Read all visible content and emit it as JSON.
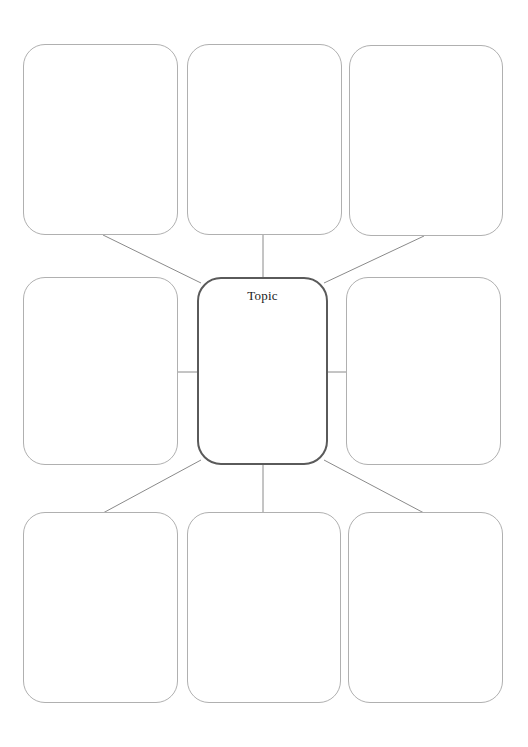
{
  "page": {
    "background_color": "#ffffff",
    "width": 528,
    "height": 747
  },
  "styles": {
    "node_border_color": "#b0b0b0",
    "center_border_color": "#5a5a5a",
    "connector_color": "#8a8a8a",
    "label_color": "#1b1b1b"
  },
  "organizer": {
    "center": {
      "id": "center-topic",
      "label": "Topic",
      "x": 197,
      "y": 277,
      "width": 131,
      "height": 188
    },
    "nodes": [
      {
        "id": "node-top-left",
        "label": "",
        "x": 23,
        "y": 44,
        "width": 155,
        "height": 191
      },
      {
        "id": "node-top-center",
        "label": "",
        "x": 187,
        "y": 44,
        "width": 155,
        "height": 191
      },
      {
        "id": "node-top-right",
        "label": "",
        "x": 349,
        "y": 45,
        "width": 154,
        "height": 191
      },
      {
        "id": "node-middle-left",
        "label": "",
        "x": 23,
        "y": 277,
        "width": 155,
        "height": 188
      },
      {
        "id": "node-middle-right",
        "label": "",
        "x": 346,
        "y": 277,
        "width": 155,
        "height": 188
      },
      {
        "id": "node-bottom-left",
        "label": "",
        "x": 23,
        "y": 512,
        "width": 155,
        "height": 191
      },
      {
        "id": "node-bottom-center",
        "label": "",
        "x": 187,
        "y": 512,
        "width": 154,
        "height": 191
      },
      {
        "id": "node-bottom-right",
        "label": "",
        "x": 348,
        "y": 512,
        "width": 155,
        "height": 191
      }
    ],
    "connectors": [
      {
        "id": "connector-top-left",
        "from": "node-top-left",
        "to": "center-topic",
        "x1": 103,
        "y1": 235,
        "x2": 201,
        "y2": 283
      },
      {
        "id": "connector-top-center",
        "from": "node-top-center",
        "to": "center-topic",
        "x1": 263,
        "y1": 235,
        "x2": 263,
        "y2": 277
      },
      {
        "id": "connector-top-right",
        "from": "node-top-right",
        "to": "center-topic",
        "x1": 424,
        "y1": 236,
        "x2": 324,
        "y2": 283
      },
      {
        "id": "connector-middle-left",
        "from": "node-middle-left",
        "to": "center-topic",
        "x1": 178,
        "y1": 372,
        "x2": 197,
        "y2": 372
      },
      {
        "id": "connector-middle-right",
        "from": "node-middle-right",
        "to": "center-topic",
        "x1": 328,
        "y1": 372,
        "x2": 346,
        "y2": 372
      },
      {
        "id": "connector-bottom-left",
        "from": "center-topic",
        "to": "node-bottom-left",
        "x1": 201,
        "y1": 460,
        "x2": 103,
        "y2": 513
      },
      {
        "id": "connector-bottom-center",
        "from": "center-topic",
        "to": "node-bottom-center",
        "x1": 263,
        "y1": 465,
        "x2": 263,
        "y2": 512
      },
      {
        "id": "connector-bottom-right",
        "from": "center-topic",
        "to": "node-bottom-right",
        "x1": 324,
        "y1": 460,
        "x2": 424,
        "y2": 513
      }
    ]
  }
}
